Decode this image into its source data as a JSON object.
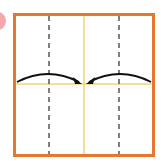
{
  "diagram": {
    "type": "origami-fold-step",
    "colors": {
      "paper_border": "#E8772E",
      "center_crease": "#F2D27A",
      "dashed_fold": "#555555",
      "arrow": "#111111",
      "step_badge": "#F4A6AE",
      "paper_fill": "#FFFFFF"
    },
    "square": {
      "x": 14,
      "y": 14,
      "width": 140,
      "height": 142
    },
    "center_vertical_x": 84,
    "center_horizontal_y": 84,
    "dashed_lines_x": [
      49,
      119
    ],
    "arrows": [
      {
        "from": "left-edge",
        "to": "center"
      },
      {
        "from": "right-edge",
        "to": "center"
      }
    ],
    "step_badge_visible": true
  }
}
